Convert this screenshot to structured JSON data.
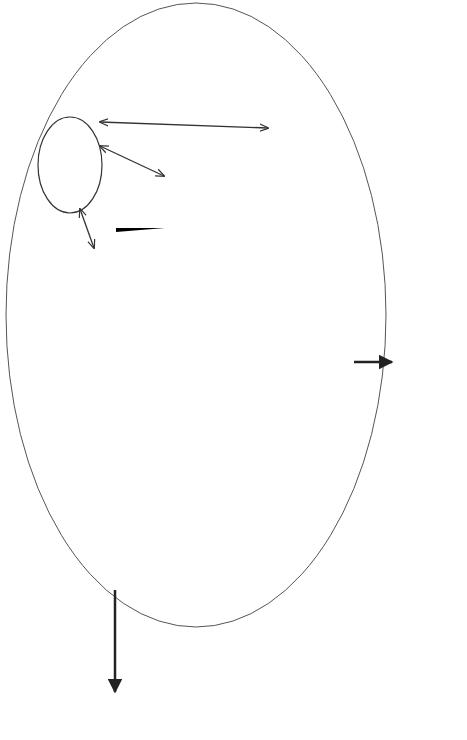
{
  "process_input": {
    "title": "Process Input",
    "items": [
      {
        "level": 1,
        "text": "Customer needs/objectives/"
      },
      {
        "level": 0,
        "text": "Requirements"
      },
      {
        "level": 2,
        "text": "Missions"
      },
      {
        "level": 2,
        "text": "Measures of effectiveness"
      },
      {
        "level": 2,
        "text": "Environments"
      },
      {
        "level": 2,
        "text": "Constraints"
      },
      {
        "level": 1,
        "text": "Technology base"
      },
      {
        "level": 1,
        "text": "Outputs from prior phase"
      },
      {
        "level": 1,
        "text": "Program decision"
      },
      {
        "level": 0,
        "text": "requirements"
      },
      {
        "level": 1,
        "text": "Requirements applied through"
      },
      {
        "level": 0,
        "text": "specifications and standards"
      }
    ]
  },
  "process_output": {
    "title": "Process Output",
    "items": [
      {
        "level": 1,
        "text": "Phase dependent"
      },
      {
        "level": 2,
        "text": "Decision support data"
      },
      {
        "level": 2,
        "text": "System architecture"
      },
      {
        "level": 2,
        "text": "Specifications & baselines"
      }
    ]
  },
  "system_analysis": {
    "line1": "System analysis",
    "line2": "& control",
    "line3": "(balance)",
    "items": [
      {
        "level": 1,
        "text": "Trade-off studies"
      },
      {
        "level": 1,
        "text": "Effectiveness analyses"
      },
      {
        "level": 1,
        "text": "Risk management"
      },
      {
        "level": 1,
        "text": "Configuration management"
      },
      {
        "level": 1,
        "text": "Interface management"
      },
      {
        "level": 1,
        "text": "Data management"
      },
      {
        "level": 1,
        "text": "Performance based"
      },
      {
        "level": 0,
        "text": "progress measurement"
      },
      {
        "level": 2,
        "text": "SEMS"
      },
      {
        "level": 2,
        "text": "TPM"
      },
      {
        "level": 2,
        "text": "Technical reviews"
      }
    ]
  },
  "requirements_analysis": {
    "title": "Requirements Analysis",
    "items": [
      {
        "level": 1,
        "text": "Analyze missions & environments"
      },
      {
        "level": 1,
        "text": "Identify functional requirements"
      },
      {
        "level": 1,
        "text": "Define/refine performance &"
      },
      {
        "level": 0,
        "text": "design constraint requirements"
      }
    ]
  },
  "functional_analysis": {
    "title": "Functional Analysis/Allocation",
    "items": [
      {
        "level": 1,
        "text": "Decompose to lower-level functions"
      },
      {
        "level": 1,
        "text": "Allocate performance & other limiting"
      },
      {
        "level": 0,
        "text": "requirements to all functional levels"
      },
      {
        "level": 1,
        "text": "Define/refine functional interfaces (internal/external)"
      },
      {
        "level": 1,
        "text": "Define/refine/integrate functional architecture"
      }
    ]
  },
  "synthesis": {
    "title": "Synthesis",
    "items": [
      {
        "level": 1,
        "text": "Transform architectures (functional to physical)"
      },
      {
        "level": 1,
        "text": "Define alternative system concepts,"
      },
      {
        "level": 0,
        "text": "configuration items & system elements"
      },
      {
        "level": 1,
        "text": "Define/refine physical interfaces (internal/external)"
      },
      {
        "level": 1,
        "text": "Select preferred product & process solutions"
      }
    ]
  },
  "loops": {
    "requirements": "Requirements loop",
    "design": "Design loop",
    "verification": "Verification"
  },
  "caption": "Figure 7.1 Military Standard 499B systems engineering process"
}
